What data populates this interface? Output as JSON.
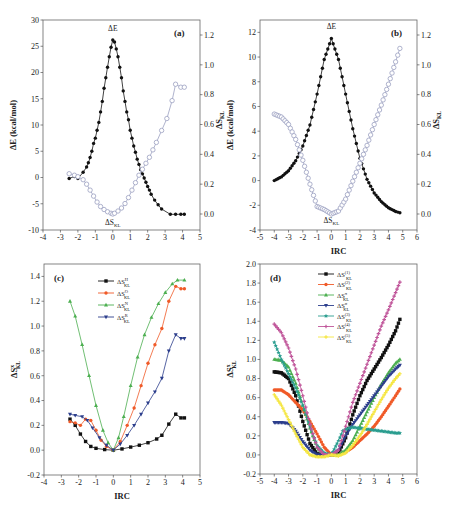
{
  "figure": {
    "panels": [
      "(a)",
      "(b)",
      "(c)",
      "(d)"
    ]
  },
  "chart_data": [
    {
      "id": "a",
      "type": "line",
      "title": "(a)",
      "xlabel": "",
      "ylabel": "ΔE (kcal/mol)",
      "y2label": "ΔS_KL",
      "xlim": [
        -4,
        5
      ],
      "ylim": [
        -10,
        30
      ],
      "y2lim": [
        -0.1,
        1.3
      ],
      "xticks": [
        -4,
        -3,
        -2,
        -1,
        0,
        1,
        2,
        3,
        4,
        5
      ],
      "yticks": [
        -10,
        -5,
        0,
        5,
        10,
        15,
        20,
        25,
        30
      ],
      "y2ticks": [
        0.0,
        0.2,
        0.4,
        0.6,
        0.8,
        1.0,
        1.2
      ],
      "annotations": [
        {
          "text": "ΔE",
          "x": 0,
          "y": 28
        },
        {
          "text": "ΔS_KL",
          "x": 0,
          "y": -9
        }
      ],
      "series": [
        {
          "name": "ΔE",
          "axis": "left",
          "color": "#111111",
          "marker": "filled-circle",
          "x": [
            -2.5,
            -2.2,
            -2.0,
            -1.7,
            -1.5,
            -1.4,
            -1.3,
            -1.2,
            -1.1,
            -1.0,
            -0.9,
            -0.8,
            -0.7,
            -0.6,
            -0.5,
            -0.4,
            -0.3,
            -0.2,
            -0.1,
            0.0,
            0.1,
            0.2,
            0.3,
            0.4,
            0.5,
            0.6,
            0.7,
            0.8,
            0.9,
            1.0,
            1.1,
            1.2,
            1.3,
            1.4,
            1.5,
            1.6,
            1.7,
            1.8,
            1.9,
            2.0,
            2.1,
            2.2,
            2.4,
            2.6,
            2.8,
            3.3,
            3.6,
            3.9,
            4.1
          ],
          "y": [
            -0.2,
            0.2,
            -0.2,
            1.0,
            2.0,
            2.8,
            3.8,
            5.0,
            6.5,
            7.5,
            9.0,
            10.5,
            12.5,
            14.5,
            17.0,
            19.0,
            21.0,
            23.0,
            24.8,
            26.2,
            25.8,
            24.5,
            23.0,
            21.0,
            19.0,
            16.5,
            14.5,
            12.5,
            11.0,
            9.0,
            7.5,
            6.0,
            4.8,
            3.5,
            2.5,
            1.5,
            0.7,
            -0.1,
            -0.9,
            -1.7,
            -2.4,
            -3.2,
            -4.3,
            -5.2,
            -6.0,
            -7.0,
            -7.0,
            -7.0,
            -7.0
          ]
        },
        {
          "name": "ΔS_KL",
          "axis": "right",
          "color": "#9aa0c0",
          "marker": "open-circle",
          "x": [
            -2.5,
            -2.2,
            -2.0,
            -1.7,
            -1.5,
            -1.3,
            -1.1,
            -0.9,
            -0.7,
            -0.5,
            -0.3,
            -0.1,
            0.0,
            0.1,
            0.3,
            0.5,
            0.7,
            0.9,
            1.1,
            1.3,
            1.5,
            1.7,
            1.9,
            2.1,
            2.3,
            2.5,
            2.8,
            3.1,
            3.4,
            3.6,
            3.9,
            4.1
          ],
          "y": [
            0.27,
            0.26,
            0.25,
            0.23,
            0.2,
            0.16,
            0.12,
            0.08,
            0.05,
            0.03,
            0.015,
            0.005,
            0.0,
            0.005,
            0.02,
            0.04,
            0.07,
            0.11,
            0.16,
            0.21,
            0.26,
            0.3,
            0.34,
            0.38,
            0.43,
            0.48,
            0.56,
            0.64,
            0.76,
            0.87,
            0.85,
            0.85
          ]
        }
      ]
    },
    {
      "id": "b",
      "type": "line",
      "title": "(b)",
      "xlabel": "IRC",
      "ylabel": "ΔE (kcal/mol)",
      "y2label": "ΔS_KL",
      "xlim": [
        -5,
        6
      ],
      "ylim": [
        -4,
        13
      ],
      "y2lim": [
        -0.1,
        1.3
      ],
      "xticks": [
        -5,
        -4,
        -3,
        -2,
        -1,
        0,
        1,
        2,
        3,
        4,
        5,
        6
      ],
      "yticks": [
        -4,
        -2,
        0,
        2,
        4,
        6,
        8,
        10,
        12
      ],
      "y2ticks": [
        0.0,
        0.2,
        0.4,
        0.6,
        0.8,
        1.0,
        1.2
      ],
      "annotations": [
        {
          "text": "ΔE",
          "x": 0,
          "y": 12.3
        },
        {
          "text": "ΔS_KL",
          "x": 0,
          "y": -3.4
        }
      ],
      "series": [
        {
          "name": "ΔE",
          "axis": "left",
          "color": "#111111",
          "marker": "filled-circle",
          "function": "gaussian",
          "x": [
            -4.0,
            -3.5,
            -3.0,
            -2.5,
            -2.0,
            -1.5,
            -1.0,
            -0.5,
            0.0,
            0.5,
            1.0,
            1.5,
            2.0,
            2.5,
            3.0,
            3.5,
            4.0,
            4.5,
            4.8
          ],
          "y": [
            0.0,
            0.3,
            0.8,
            1.6,
            2.8,
            4.5,
            7.0,
            9.8,
            11.5,
            9.8,
            7.0,
            4.2,
            1.8,
            0.1,
            -1.0,
            -1.7,
            -2.2,
            -2.5,
            -2.6
          ]
        },
        {
          "name": "ΔS_KL",
          "axis": "right",
          "color": "#9aa0c0",
          "marker": "open-circle",
          "x": [
            -4.0,
            -3.5,
            -3.0,
            -2.5,
            -2.0,
            -1.5,
            -1.0,
            -0.5,
            0.0,
            0.5,
            1.0,
            1.5,
            2.0,
            2.5,
            3.0,
            3.5,
            4.0,
            4.5,
            4.8
          ],
          "y": [
            0.67,
            0.65,
            0.6,
            0.5,
            0.36,
            0.2,
            0.05,
            0.03,
            0.0,
            0.02,
            0.1,
            0.22,
            0.34,
            0.46,
            0.6,
            0.73,
            0.87,
            1.02,
            1.11
          ]
        }
      ]
    },
    {
      "id": "c",
      "type": "line",
      "title": "(c)",
      "xlabel": "IRC",
      "ylabel": "ΔS^x_KL",
      "xlim": [
        -4,
        5
      ],
      "ylim": [
        -0.2,
        1.5
      ],
      "xticks": [
        -4,
        -3,
        -2,
        -1,
        0,
        1,
        2,
        3,
        4,
        5
      ],
      "yticks": [
        -0.2,
        0.0,
        0.2,
        0.4,
        0.6,
        0.8,
        1.0,
        1.2,
        1.4
      ],
      "legend": {
        "position": "upper-center"
      },
      "series": [
        {
          "name": "ΔS^H_KL",
          "color": "#111111",
          "marker": "square",
          "x": [
            -2.5,
            -2.2,
            -1.9,
            -1.6,
            -1.3,
            -1.0,
            -0.5,
            0.0,
            0.5,
            1.0,
            1.5,
            2.0,
            2.5,
            2.8,
            3.2,
            3.6,
            3.9,
            4.1
          ],
          "y": [
            0.25,
            0.2,
            0.13,
            0.07,
            0.03,
            0.015,
            0.005,
            0.0,
            0.01,
            0.025,
            0.04,
            0.06,
            0.09,
            0.12,
            0.21,
            0.29,
            0.26,
            0.26
          ]
        },
        {
          "name": "ΔS^O_KL",
          "color": "#f05a28",
          "marker": "circle",
          "x": [
            -2.5,
            -2.2,
            -1.9,
            -1.6,
            -1.3,
            -1.0,
            -0.7,
            -0.4,
            0.0,
            0.4,
            0.8,
            1.2,
            1.6,
            2.0,
            2.4,
            2.8,
            3.2,
            3.6,
            3.9,
            4.1
          ],
          "y": [
            0.23,
            0.22,
            0.2,
            0.25,
            0.24,
            0.16,
            0.08,
            0.03,
            0.0,
            0.07,
            0.2,
            0.34,
            0.52,
            0.7,
            0.85,
            0.98,
            1.2,
            1.32,
            1.3,
            1.3
          ]
        },
        {
          "name": "ΔS^N_KL",
          "color": "#4caf50",
          "marker": "triangle-up",
          "x": [
            -2.5,
            -2.2,
            -1.8,
            -1.4,
            -1.0,
            -0.6,
            -0.3,
            0.0,
            0.3,
            0.6,
            1.0,
            1.4,
            1.8,
            2.2,
            2.6,
            3.0,
            3.4,
            3.7,
            4.1
          ],
          "y": [
            1.2,
            1.08,
            0.85,
            0.6,
            0.36,
            0.16,
            0.06,
            0.0,
            0.1,
            0.27,
            0.52,
            0.75,
            0.93,
            1.07,
            1.18,
            1.27,
            1.34,
            1.37,
            1.37
          ]
        },
        {
          "name": "ΔS^R_KL",
          "color": "#2c3e8c",
          "marker": "triangle-down",
          "x": [
            -2.5,
            -2.2,
            -1.8,
            -1.5,
            -1.2,
            -0.8,
            -0.4,
            0.0,
            0.4,
            0.8,
            1.2,
            1.6,
            2.0,
            2.4,
            2.8,
            3.2,
            3.6,
            3.9,
            4.1
          ],
          "y": [
            0.29,
            0.28,
            0.27,
            0.24,
            0.18,
            0.1,
            0.04,
            0.0,
            0.05,
            0.12,
            0.2,
            0.29,
            0.38,
            0.47,
            0.58,
            0.8,
            0.93,
            0.9,
            0.9
          ]
        }
      ]
    },
    {
      "id": "d",
      "type": "line",
      "title": "(d)",
      "xlabel": "IRC",
      "ylabel": "ΔS^x_KL",
      "xlim": [
        -5,
        6
      ],
      "ylim": [
        -0.2,
        2.0
      ],
      "xticks": [
        -5,
        -4,
        -3,
        -2,
        -1,
        0,
        1,
        2,
        3,
        4,
        5,
        6
      ],
      "yticks": [
        -0.2,
        0.0,
        0.2,
        0.4,
        0.6,
        0.8,
        1.0,
        1.2,
        1.4,
        1.6,
        1.8,
        2.0
      ],
      "legend": {
        "position": "upper-center"
      },
      "series": [
        {
          "name": "ΔS^(1)_KL",
          "color": "#111111",
          "marker": "square",
          "x": [
            -4.0,
            -3.5,
            -3.0,
            -2.5,
            -2.0,
            -1.5,
            -1.0,
            -0.5,
            0.0,
            0.5,
            1.0,
            1.5,
            2.0,
            2.5,
            3.0,
            3.5,
            4.0,
            4.5,
            4.8
          ],
          "y": [
            0.87,
            0.86,
            0.8,
            0.62,
            0.35,
            0.12,
            0.01,
            0.0,
            0.0,
            0.02,
            0.18,
            0.42,
            0.62,
            0.78,
            0.9,
            1.02,
            1.15,
            1.3,
            1.42
          ]
        },
        {
          "name": "ΔS^(2)_KL",
          "color": "#f05a28",
          "marker": "circle",
          "x": [
            -4.0,
            -3.5,
            -3.0,
            -2.5,
            -2.0,
            -1.5,
            -1.0,
            -0.5,
            0.0,
            0.5,
            1.0,
            1.5,
            2.0,
            2.5,
            3.0,
            3.5,
            4.0,
            4.5,
            4.8
          ],
          "y": [
            0.68,
            0.68,
            0.63,
            0.55,
            0.47,
            0.35,
            0.22,
            0.08,
            0.0,
            0.0,
            0.03,
            0.08,
            0.15,
            0.22,
            0.3,
            0.4,
            0.51,
            0.62,
            0.69
          ]
        },
        {
          "name": "ΔS^π_KL",
          "color": "#4caf50",
          "marker": "triangle-up",
          "x": [
            -4.0,
            -3.5,
            -3.0,
            -2.5,
            -2.0,
            -1.5,
            -1.0,
            -0.5,
            0.0,
            0.5,
            1.0,
            1.5,
            2.0,
            2.5,
            3.0,
            3.5,
            4.0,
            4.5,
            4.8
          ],
          "y": [
            1.0,
            0.99,
            0.92,
            0.75,
            0.52,
            0.28,
            0.08,
            0.0,
            0.0,
            0.0,
            0.05,
            0.15,
            0.3,
            0.45,
            0.6,
            0.74,
            0.86,
            0.96,
            1.0
          ]
        },
        {
          "name": "ΔS^σ_KL",
          "color": "#2c3e8c",
          "marker": "triangle-down",
          "x": [
            -4.0,
            -3.5,
            -3.0,
            -2.5,
            -2.0,
            -1.5,
            -1.0,
            -0.5,
            0.0,
            0.5,
            1.0,
            1.5,
            2.0,
            2.5,
            3.0,
            3.5,
            4.0,
            4.5,
            4.8
          ],
          "y": [
            0.34,
            0.34,
            0.33,
            0.25,
            0.14,
            0.05,
            0.0,
            0.0,
            0.0,
            0.05,
            0.2,
            0.32,
            0.42,
            0.52,
            0.62,
            0.72,
            0.82,
            0.9,
            0.94
          ]
        },
        {
          "name": "ΔS^(3)_KL",
          "color": "#2a9d8f",
          "marker": "star",
          "x": [
            -4.0,
            -3.5,
            -3.0,
            -2.5,
            -2.0,
            -1.5,
            -1.0,
            -0.5,
            0.0,
            0.5,
            0.8,
            1.0,
            1.5,
            2.0,
            2.5,
            3.0,
            3.5,
            4.0,
            4.5,
            4.8
          ],
          "y": [
            1.18,
            1.0,
            0.85,
            0.7,
            0.52,
            0.3,
            0.1,
            0.02,
            0.0,
            0.15,
            0.25,
            0.27,
            0.29,
            0.28,
            0.27,
            0.26,
            0.25,
            0.24,
            0.23,
            0.23
          ]
        },
        {
          "name": "ΔS^(4)_KL",
          "color": "#c0569a",
          "marker": "cross",
          "x": [
            -4.0,
            -3.5,
            -3.0,
            -2.5,
            -2.0,
            -1.5,
            -1.0,
            -0.5,
            0.0,
            0.5,
            1.0,
            1.5,
            2.0,
            2.5,
            3.0,
            3.5,
            4.0,
            4.5,
            4.8
          ],
          "y": [
            1.37,
            1.28,
            1.12,
            0.9,
            0.62,
            0.32,
            0.08,
            0.0,
            0.0,
            0.05,
            0.3,
            0.55,
            0.75,
            0.95,
            1.15,
            1.35,
            1.52,
            1.7,
            1.81
          ]
        },
        {
          "name": "ΔS^(5)_KL",
          "color": "#f5e642",
          "marker": "cross",
          "x": [
            -4.0,
            -3.5,
            -3.0,
            -2.5,
            -2.0,
            -1.5,
            -1.0,
            -0.5,
            0.0,
            0.5,
            1.0,
            1.5,
            2.0,
            2.5,
            3.0,
            3.5,
            4.0,
            4.5,
            4.8
          ],
          "y": [
            0.63,
            0.52,
            0.37,
            0.22,
            0.08,
            0.0,
            -0.02,
            -0.02,
            0.0,
            -0.01,
            0.02,
            0.1,
            0.2,
            0.32,
            0.45,
            0.58,
            0.7,
            0.8,
            0.85
          ]
        }
      ]
    }
  ]
}
